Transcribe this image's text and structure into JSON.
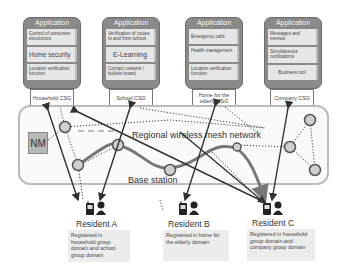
{
  "applications": [
    {
      "title": "Application",
      "items": [
        "Control of consumer electronics",
        "Home security",
        "Location verification function"
      ],
      "csg": "Household CSG"
    },
    {
      "title": "Application",
      "items": [
        "Verification of routes to and from school",
        "E-Learning",
        "Contact network / bulletin board"
      ],
      "csg": "School CSG"
    },
    {
      "title": "Application",
      "items": [
        "Emergency calls",
        "Health management",
        "Location verification function"
      ],
      "csg": "Home for the elderly CSG"
    },
    {
      "title": "Application",
      "items": [
        "Messages and memos",
        "Simultaneous notifications",
        "Business tool"
      ],
      "csg": "Company CSG"
    }
  ],
  "network": {
    "nm_label": "NM",
    "mesh_label": "Regional wireless mesh network",
    "base_station_label": "Base station"
  },
  "residents": [
    {
      "name": "Resident A",
      "note": "Registered in household group domain and school group domain"
    },
    {
      "name": "Resident B",
      "note": "Registered in home for the elderly domain"
    },
    {
      "name": "Resident C",
      "note": "Registered in household group domain and company group domain"
    }
  ],
  "colors": {
    "app_box": "#8a8a8a",
    "item_bg": "#e6e6e6",
    "node_fill": "#cccccc",
    "node_stroke": "#555555",
    "arrow": "#333333"
  }
}
